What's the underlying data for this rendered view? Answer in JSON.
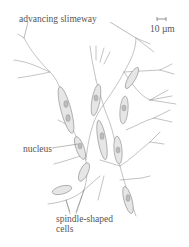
{
  "figure": {
    "type": "biological illustration",
    "labels": {
      "advancing_slimeway": "advancing slimeway",
      "nucleus": "nucleus",
      "spindle_line1": "spindle-shaped",
      "spindle_line2": "cells"
    },
    "scale_bar": {
      "label": "10 µm"
    },
    "colors": {
      "line": "#8a8a8a",
      "cell_fill": "#e4e4e4",
      "text": "#555555"
    }
  }
}
